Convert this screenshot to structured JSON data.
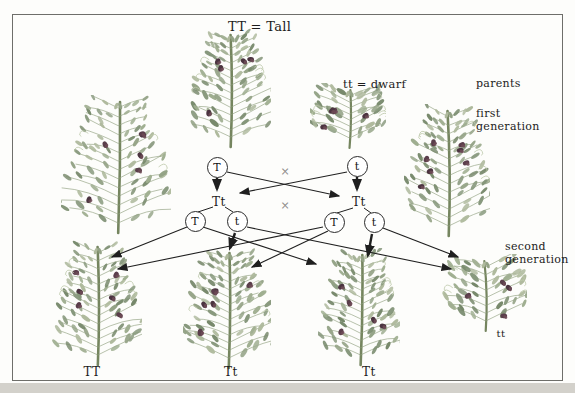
{
  "figure": {
    "legend_tall": "TT = Tall",
    "legend_dwarf": "tt = dwarf",
    "cross_symbol": "×"
  },
  "generation_labels": {
    "parents": "parents",
    "first_line1": "first",
    "first_line2": "generation",
    "second_line1": "second",
    "second_line2": "generation"
  },
  "parent_gametes": {
    "left": "T",
    "right": "t"
  },
  "f1_genotypes": {
    "left": "Tt",
    "right": "Tt"
  },
  "f1_gametes": {
    "g1": "T",
    "g2": "t",
    "g3": "T",
    "g4": "t"
  },
  "f2_genotypes": {
    "p1": "TT",
    "p2": "Tt",
    "p3": "Tt",
    "p4": "tt"
  },
  "colors": {
    "leaf": "#93a285",
    "leaf_light": "#aeb99c",
    "leaf_dark": "#76886a",
    "flower": "#5a3e4b",
    "stem": "#75855f",
    "line": "#1f1f1f"
  }
}
